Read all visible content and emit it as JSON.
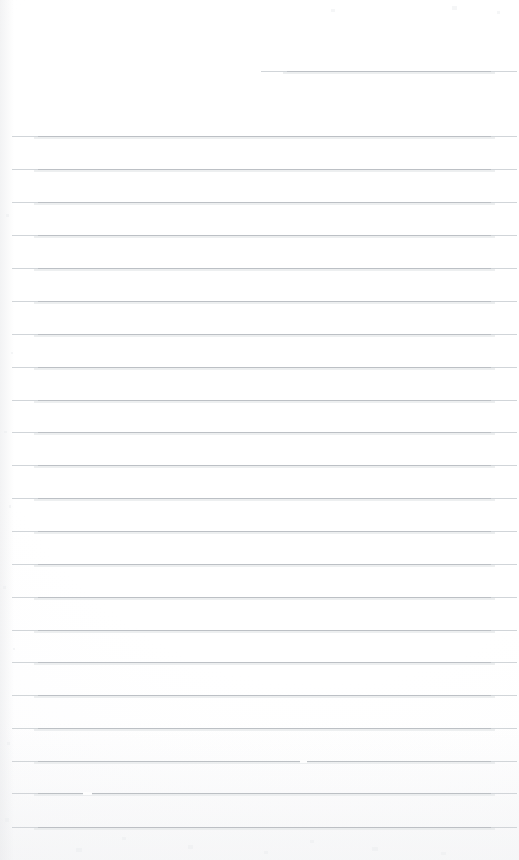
{
  "document": {
    "kind": "scanned-ruled-notebook-page",
    "title": "Blank Ruled Notebook Page",
    "page_width": 519,
    "page_height": 860,
    "background_color": "#fefefe",
    "paper_tone": "#fdfdfd",
    "rule_color": "#b9bdc2",
    "rule_feather_color": "#cfd3d7",
    "rule_halo_color": "#e6e8ea",
    "written_content": "",
    "text_lines": [],
    "header_text": "",
    "page_number": ""
  },
  "ruling": {
    "style": "wide-ruled",
    "line_count": 23,
    "line_spacing_px": 32.8,
    "first_line_y": 71,
    "body_first_line_y": 136,
    "left_margin_x": 34,
    "right_margin_x": 495,
    "margin_rule": "none",
    "header_line": {
      "label": "header-rule",
      "y": 71,
      "x_start": 283,
      "x_end": 495,
      "note": "short top rule, indented from left"
    },
    "lines": [
      {
        "index": 1,
        "y": 71,
        "x_start": 283,
        "x_end": 495,
        "full_width": false
      },
      {
        "index": 2,
        "y": 136,
        "x_start": 34,
        "x_end": 495,
        "full_width": true
      },
      {
        "index": 3,
        "y": 169,
        "x_start": 34,
        "x_end": 495,
        "full_width": true
      },
      {
        "index": 4,
        "y": 202,
        "x_start": 34,
        "x_end": 495,
        "full_width": true
      },
      {
        "index": 5,
        "y": 235,
        "x_start": 34,
        "x_end": 495,
        "full_width": true
      },
      {
        "index": 6,
        "y": 268,
        "x_start": 34,
        "x_end": 495,
        "full_width": true
      },
      {
        "index": 7,
        "y": 301,
        "x_start": 34,
        "x_end": 495,
        "full_width": true
      },
      {
        "index": 8,
        "y": 334,
        "x_start": 34,
        "x_end": 495,
        "full_width": true
      },
      {
        "index": 9,
        "y": 367,
        "x_start": 34,
        "x_end": 495,
        "full_width": true
      },
      {
        "index": 10,
        "y": 400,
        "x_start": 34,
        "x_end": 495,
        "full_width": true
      },
      {
        "index": 11,
        "y": 432,
        "x_start": 34,
        "x_end": 495,
        "full_width": true
      },
      {
        "index": 12,
        "y": 465,
        "x_start": 34,
        "x_end": 495,
        "full_width": true
      },
      {
        "index": 13,
        "y": 498,
        "x_start": 34,
        "x_end": 495,
        "full_width": true
      },
      {
        "index": 14,
        "y": 531,
        "x_start": 34,
        "x_end": 495,
        "full_width": true
      },
      {
        "index": 15,
        "y": 564,
        "x_start": 34,
        "x_end": 495,
        "full_width": true
      },
      {
        "index": 16,
        "y": 597,
        "x_start": 34,
        "x_end": 495,
        "full_width": true
      },
      {
        "index": 17,
        "y": 630,
        "x_start": 34,
        "x_end": 495,
        "full_width": true
      },
      {
        "index": 18,
        "y": 662,
        "x_start": 34,
        "x_end": 495,
        "full_width": true
      },
      {
        "index": 19,
        "y": 695,
        "x_start": 34,
        "x_end": 495,
        "full_width": true
      },
      {
        "index": 20,
        "y": 728,
        "x_start": 34,
        "x_end": 495,
        "full_width": true
      },
      {
        "index": 21,
        "y": 761,
        "x_start": 34,
        "x_end": 495,
        "full_width": true
      },
      {
        "index": 22,
        "y": 793,
        "x_start": 34,
        "x_end": 495,
        "full_width": true
      },
      {
        "index": 23,
        "y": 827,
        "x_start": 34,
        "x_end": 495,
        "full_width": true
      }
    ],
    "scan_dropouts": [
      {
        "line_index": 21,
        "x": 300,
        "width": 7
      },
      {
        "line_index": 22,
        "x": 83,
        "width": 9
      }
    ]
  }
}
